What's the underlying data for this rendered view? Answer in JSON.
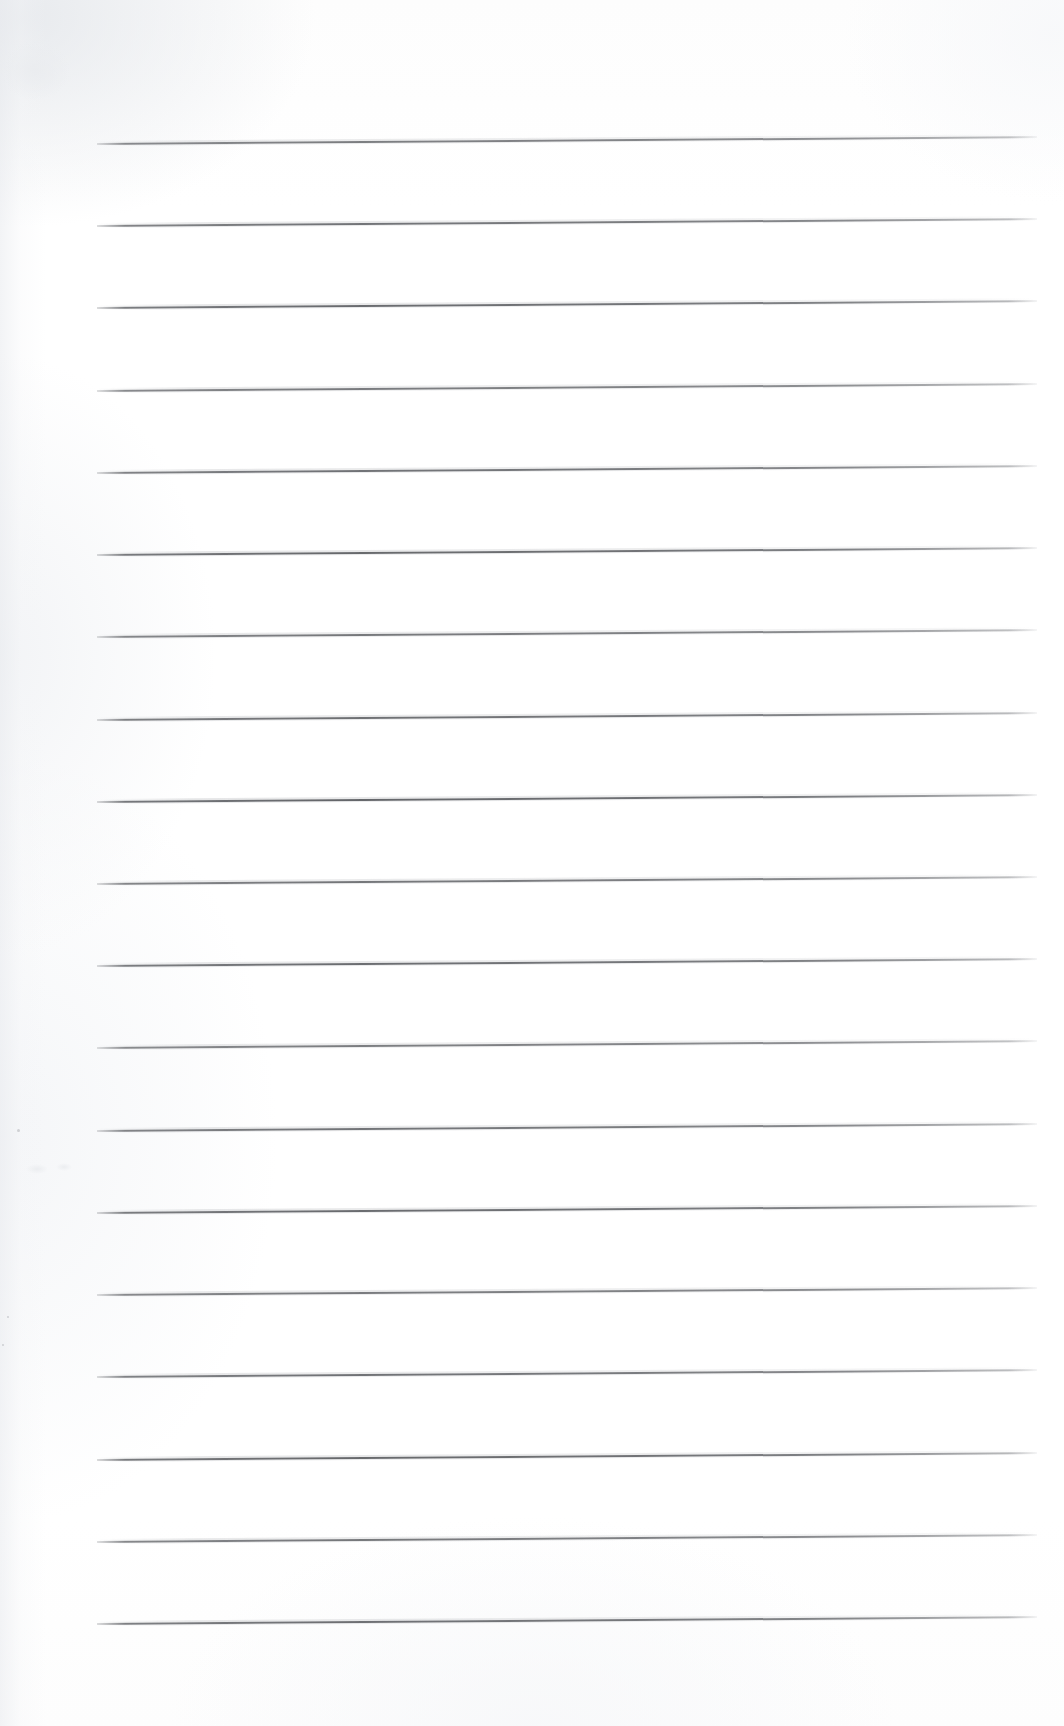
{
  "document": {
    "kind": "scanned-lined-paper",
    "title": "Blank lined notebook page",
    "page_width": 1064,
    "page_height": 1726,
    "background_color": "#ffffff",
    "paper_tone": "#fdfdfd",
    "content_text": "",
    "has_handwriting": false,
    "has_printed_text": false
  },
  "ruling": {
    "line_color": "#5c5e62",
    "line_thickness_px": 2,
    "line_count": 19,
    "left_x": 97,
    "right_x": 1037,
    "line_width_px": 940,
    "first_line_y": 143,
    "line_spacing_px": 82.2,
    "tilt_degrees": -0.42,
    "lines_y": [
      143,
      225,
      307,
      390,
      472,
      554,
      636,
      719,
      801,
      883,
      965,
      1047,
      1130,
      1212,
      1294,
      1376,
      1459,
      1541,
      1623
    ]
  },
  "margins": {
    "top_margin_px": 143,
    "bottom_margin_px": 103,
    "left_margin_px": 97,
    "right_margin_px": 27
  },
  "artifacts": {
    "specks": [
      {
        "x": 17,
        "y": 1129,
        "size": 3
      },
      {
        "x": 7,
        "y": 1316,
        "size": 2
      },
      {
        "x": 2,
        "y": 1344,
        "size": 2
      }
    ],
    "smudges": [
      {
        "x": 26,
        "y": 1164,
        "w": 22,
        "h": 10
      },
      {
        "x": 56,
        "y": 1163,
        "w": 16,
        "h": 8
      },
      {
        "x": 0,
        "y": 40,
        "w": 70,
        "h": 60
      }
    ]
  }
}
